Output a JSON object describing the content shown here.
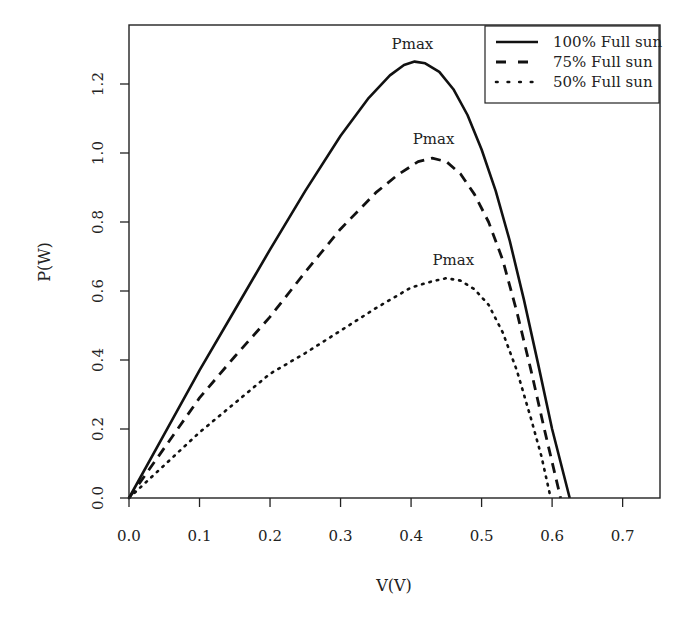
{
  "chart_data": {
    "type": "line",
    "title": "",
    "xlabel": "V(V)",
    "ylabel": "P(W)",
    "xlim": [
      0.0,
      0.753
    ],
    "ylim": [
      0.0,
      1.371
    ],
    "xticks": [
      0.0,
      0.1,
      0.2,
      0.3,
      0.4,
      0.5,
      0.6,
      0.7
    ],
    "xtick_labels": [
      "0.0",
      "0.1",
      "0.2",
      "0.3",
      "0.4",
      "0.5",
      "0.6",
      "0.7"
    ],
    "yticks": [
      0.0,
      0.2,
      0.4,
      0.6,
      0.8,
      1.0,
      1.2
    ],
    "ytick_labels": [
      "0.0",
      "0.2",
      "0.4",
      "0.6",
      "0.8",
      "1.0",
      "1.2"
    ],
    "grid": false,
    "legend_position": "top-right",
    "series": [
      {
        "name": "100% Full sun",
        "style": "solid",
        "color": "#111111",
        "x": [
          0.0,
          0.05,
          0.1,
          0.15,
          0.2,
          0.25,
          0.3,
          0.34,
          0.37,
          0.39,
          0.405,
          0.42,
          0.44,
          0.46,
          0.48,
          0.5,
          0.52,
          0.54,
          0.56,
          0.58,
          0.6,
          0.625
        ],
        "y": [
          0.0,
          0.185,
          0.37,
          0.545,
          0.72,
          0.89,
          1.05,
          1.16,
          1.225,
          1.255,
          1.265,
          1.26,
          1.235,
          1.185,
          1.11,
          1.01,
          0.89,
          0.745,
          0.575,
          0.39,
          0.2,
          0.0
        ]
      },
      {
        "name": "75% Full sun",
        "style": "dashed",
        "color": "#111111",
        "x": [
          0.0,
          0.05,
          0.1,
          0.15,
          0.2,
          0.25,
          0.3,
          0.35,
          0.38,
          0.41,
          0.43,
          0.45,
          0.47,
          0.49,
          0.51,
          0.53,
          0.55,
          0.57,
          0.59,
          0.612
        ],
        "y": [
          0.0,
          0.145,
          0.29,
          0.41,
          0.525,
          0.655,
          0.78,
          0.885,
          0.935,
          0.975,
          0.985,
          0.975,
          0.94,
          0.88,
          0.8,
          0.69,
          0.54,
          0.37,
          0.19,
          0.0
        ]
      },
      {
        "name": "50% Full sun",
        "style": "dotted",
        "color": "#111111",
        "x": [
          0.0,
          0.05,
          0.1,
          0.15,
          0.2,
          0.25,
          0.3,
          0.35,
          0.4,
          0.43,
          0.45,
          0.47,
          0.49,
          0.51,
          0.53,
          0.55,
          0.57,
          0.585,
          0.598
        ],
        "y": [
          0.0,
          0.095,
          0.19,
          0.275,
          0.36,
          0.42,
          0.485,
          0.55,
          0.61,
          0.628,
          0.637,
          0.63,
          0.605,
          0.56,
          0.48,
          0.37,
          0.23,
          0.12,
          0.0
        ]
      }
    ],
    "annotations": [
      {
        "text": "Pmax",
        "x": 0.402,
        "y": 1.3
      },
      {
        "text": "Pmax",
        "x": 0.432,
        "y": 1.025
      },
      {
        "text": "Pmax",
        "x": 0.46,
        "y": 0.675
      }
    ]
  }
}
